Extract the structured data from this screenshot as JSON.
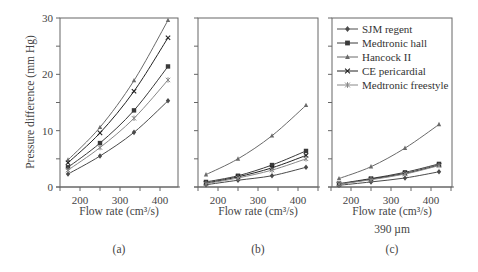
{
  "chart_data": [
    {
      "type": "line",
      "panel_label": "(a)",
      "xlabel": "Flow rate (cm³/s)",
      "ylabel": "Pressure difference (mm Hg)",
      "ylim": [
        0,
        30
      ],
      "xlim": [
        150,
        445
      ],
      "x_ticks": [
        200,
        300,
        400
      ],
      "y_ticks": [
        0,
        10,
        20,
        30
      ],
      "x": [
        170,
        250,
        335,
        420
      ],
      "grid": false,
      "series": [
        {
          "name": "SJM regent",
          "values": [
            2.3,
            5.5,
            9.7,
            15.3
          ]
        },
        {
          "name": "Medtronic hall",
          "values": [
            3.5,
            7.8,
            13.6,
            21.4
          ]
        },
        {
          "name": "Hancock II",
          "values": [
            4.8,
            10.6,
            18.9,
            29.6
          ]
        },
        {
          "name": "CE pericardial",
          "values": [
            4.3,
            9.6,
            17.0,
            26.5
          ]
        },
        {
          "name": "Medtronic freestyle",
          "values": [
            3.0,
            7.0,
            12.2,
            19.0
          ]
        }
      ]
    },
    {
      "type": "line",
      "panel_label": "(b)",
      "xlabel": "Flow rate (cm³/s)",
      "ylabel": "",
      "ylim": [
        0,
        30
      ],
      "xlim": [
        150,
        445
      ],
      "x_ticks": [
        200,
        300,
        400
      ],
      "x": [
        170,
        250,
        335,
        420
      ],
      "grid": false,
      "series": [
        {
          "name": "SJM regent",
          "values": [
            0.4,
            1.2,
            2.0,
            3.5
          ]
        },
        {
          "name": "Medtronic hall",
          "values": [
            0.9,
            2.0,
            3.9,
            6.4
          ]
        },
        {
          "name": "Hancock II",
          "values": [
            2.2,
            5.0,
            9.1,
            14.5
          ]
        },
        {
          "name": "CE pericardial",
          "values": [
            0.7,
            1.8,
            3.4,
            5.6
          ]
        },
        {
          "name": "Medtronic freestyle",
          "values": [
            0.6,
            1.6,
            3.0,
            5.0
          ]
        }
      ]
    },
    {
      "type": "line",
      "panel_label": "(c)",
      "xlabel": "Flow rate (cm³/s)",
      "subtitle": "390 µm",
      "ylabel": "",
      "ylim": [
        0,
        30
      ],
      "xlim": [
        150,
        445
      ],
      "x_ticks": [
        200,
        300,
        400
      ],
      "x": [
        170,
        250,
        335,
        420
      ],
      "grid": false,
      "legend_position": "upper left inside",
      "series": [
        {
          "name": "SJM regent",
          "values": [
            0.3,
            0.9,
            1.6,
            2.7
          ]
        },
        {
          "name": "Medtronic hall",
          "values": [
            0.6,
            1.5,
            2.6,
            4.1
          ]
        },
        {
          "name": "Hancock II",
          "values": [
            1.5,
            3.6,
            6.9,
            11.1
          ]
        },
        {
          "name": "CE pericardial",
          "values": [
            0.5,
            1.4,
            2.4,
            3.9
          ]
        },
        {
          "name": "Medtronic freestyle",
          "values": [
            0.5,
            1.3,
            2.3,
            3.8
          ]
        }
      ]
    }
  ],
  "legend": {
    "items": [
      {
        "label": "SJM regent",
        "marker": "diamond",
        "color": "#4a4a4a"
      },
      {
        "label": "Medtronic hall",
        "marker": "square",
        "color": "#3a3a3a"
      },
      {
        "label": "Hancock II",
        "marker": "triangle",
        "color": "#6a6a6a"
      },
      {
        "label": "CE pericardial",
        "marker": "x",
        "color": "#222222"
      },
      {
        "label": "Medtronic freestyle",
        "marker": "asterisk",
        "color": "#888888"
      }
    ]
  },
  "labels": {
    "ylabel": "Pressure difference (mm Hg)",
    "xlabel": "Flow rate (cm³/s)",
    "subtitle_c": "390 µm",
    "panel_a": "(a)",
    "panel_b": "(b)",
    "panel_c": "(c)",
    "y_tick_labels": [
      "0",
      "10",
      "20",
      "30"
    ],
    "x_tick_labels": [
      "200",
      "300",
      "400"
    ]
  }
}
